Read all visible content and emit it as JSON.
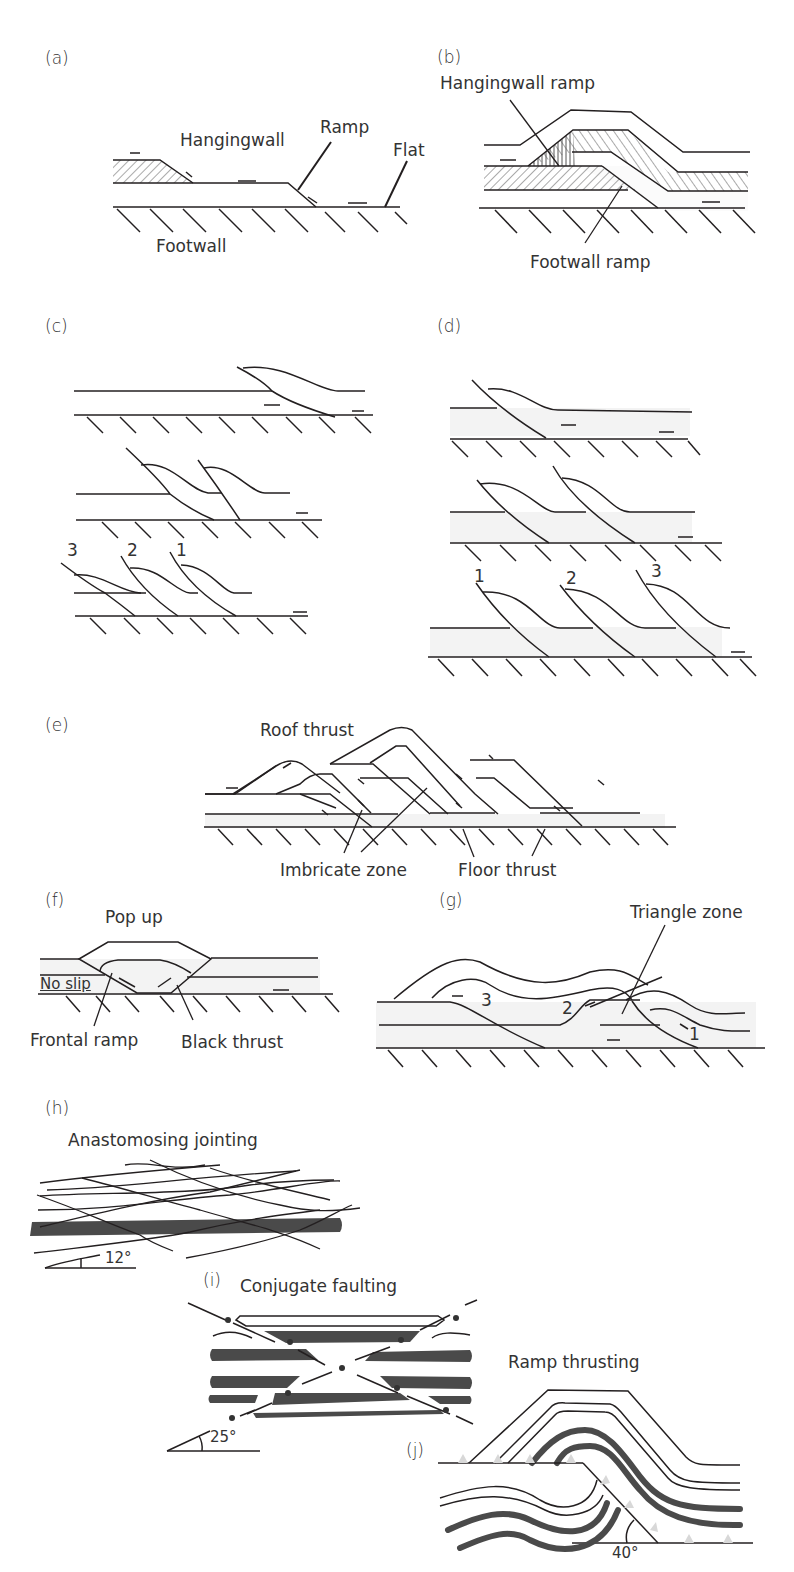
{
  "panels": {
    "a": {
      "label": "(a)",
      "annotations": {
        "hangingwall": "Hangingwall",
        "ramp": "Ramp",
        "flat": "Flat",
        "footwall": "Footwall"
      }
    },
    "b": {
      "label": "(b)",
      "annotations": {
        "hangingwall_ramp": "Hangingwall ramp",
        "footwall_ramp": "Footwall ramp"
      }
    },
    "c": {
      "label": "(c)",
      "sequence_numbers": [
        "3",
        "2",
        "1"
      ]
    },
    "d": {
      "label": "(d)",
      "sequence_numbers": [
        "1",
        "2",
        "3"
      ]
    },
    "e": {
      "label": "(e)",
      "annotations": {
        "roof_thrust": "Roof thrust",
        "imbricate_zone": "Imbricate zone",
        "floor_thrust": "Floor thrust"
      }
    },
    "f": {
      "label": "(f)",
      "annotations": {
        "pop_up": "Pop up",
        "no_slip": "No slip",
        "frontal_ramp": "Frontal ramp",
        "black_thrust": "Black thrust"
      }
    },
    "g": {
      "label": "(g)",
      "annotations": {
        "triangle_zone": "Triangle zone"
      },
      "sequence_numbers": [
        "3",
        "2",
        "1"
      ]
    },
    "h": {
      "label": "(h)",
      "annotations": {
        "title": "Anastomosing jointing",
        "angle": "12°"
      }
    },
    "i": {
      "label": "(i)",
      "annotations": {
        "title": "Conjugate faulting",
        "angle": "25°"
      }
    },
    "j": {
      "label": "(j)",
      "annotations": {
        "title": "Ramp thrusting",
        "angle": "40°"
      }
    }
  }
}
